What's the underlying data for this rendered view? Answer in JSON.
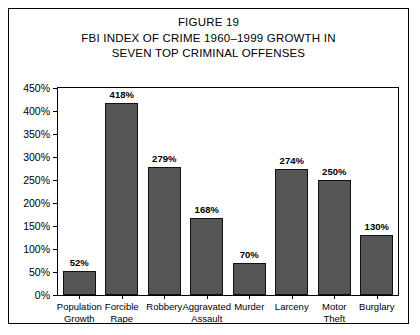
{
  "figure": {
    "title_lines": [
      "FIGURE 19",
      "FBI INDEX OF CRIME 1960–1999 GROWTH IN",
      "SEVEN TOP CRIMINAL OFFENSES"
    ]
  },
  "colors": {
    "bar_fill": "#555555",
    "bar_stroke": "#111111",
    "axis": "#000000",
    "background": "#ffffff"
  },
  "chart_data": {
    "type": "bar",
    "title": "FBI INDEX OF CRIME 1960–1999 GROWTH IN SEVEN TOP CRIMINAL OFFENSES",
    "xlabel": "",
    "ylabel": "",
    "ylim": [
      0,
      450
    ],
    "yticks": [
      0,
      50,
      100,
      150,
      200,
      250,
      300,
      350,
      400,
      450
    ],
    "ytick_labels": [
      "0%",
      "50%",
      "100%",
      "150%",
      "200%",
      "250%",
      "300%",
      "350%",
      "400%",
      "450%"
    ],
    "grid": false,
    "legend": false,
    "categories": [
      "Population Growth",
      "Forcible Rape",
      "Robbery",
      "Aggravated Assault",
      "Murder",
      "Larceny",
      "Motor Theft",
      "Burglary"
    ],
    "category_lines": [
      [
        "Population",
        "Growth"
      ],
      [
        "Forcible",
        "Rape"
      ],
      [
        "Robbery",
        ""
      ],
      [
        "Aggravated",
        "Assault"
      ],
      [
        "Murder",
        ""
      ],
      [
        "Larceny",
        ""
      ],
      [
        "Motor",
        "Theft"
      ],
      [
        "Burglary",
        ""
      ]
    ],
    "values": [
      52,
      418,
      279,
      168,
      70,
      274,
      250,
      130
    ],
    "value_labels": [
      "52%",
      "418%",
      "279%",
      "168%",
      "70%",
      "274%",
      "250%",
      "130%"
    ]
  }
}
